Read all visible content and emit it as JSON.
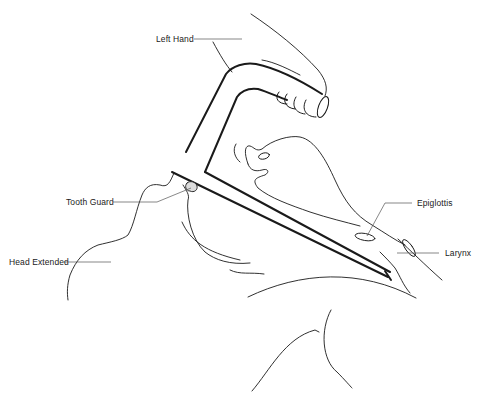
{
  "diagram": {
    "labels": [
      {
        "id": "left-hand",
        "text": "Left Hand",
        "x": 156,
        "y": 35
      },
      {
        "id": "tooth-guard",
        "text": "Tooth Guard",
        "x": 66,
        "y": 198
      },
      {
        "id": "head-extended",
        "text": "Head Extended",
        "x": 9,
        "y": 258
      },
      {
        "id": "epiglottis",
        "text": "Epiglottis",
        "x": 417,
        "y": 200
      },
      {
        "id": "larynx",
        "text": "Larynx",
        "x": 445,
        "y": 251
      }
    ],
    "colors": {
      "line": "#1a1a1a",
      "leader": "#555555",
      "background": "#ffffff"
    }
  }
}
